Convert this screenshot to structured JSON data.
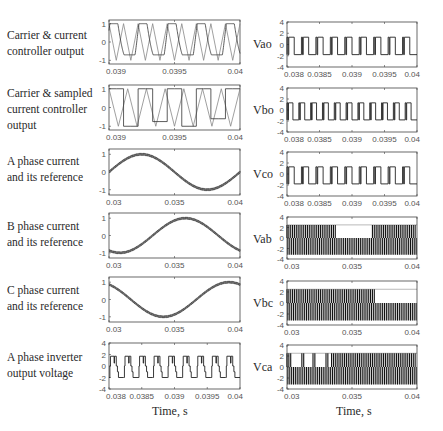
{
  "left_labels": [
    "Carrier & current\ncontroller output",
    "Carrier & sampled\ncurrent  controller\noutput",
    "A phase current\nand its reference",
    "B phase current\nand its reference",
    "C phase current\nand its reference",
    "A phase inverter\noutput voltage"
  ],
  "right_labels": [
    "Vao",
    "Vbo",
    "Vco",
    "Vab",
    "Vbc",
    "Vca"
  ],
  "xlabel_left": "Time, s",
  "xlabel_right": "Time, s",
  "chart_data": [
    {
      "type": "line",
      "title": "Carrier & current controller output",
      "xlim": [
        0.039,
        0.04
      ],
      "ylim": [
        -1.2,
        1.2
      ],
      "xticks": [
        "0.039",
        "0.0395",
        "0.04"
      ],
      "yticks": [
        "1",
        "0",
        "-1"
      ],
      "series": [
        {
          "name": "triangular carrier",
          "kind": "triangle",
          "periods": 9
        },
        {
          "name": "current controller output",
          "kind": "saturated-modulating"
        }
      ]
    },
    {
      "type": "line",
      "title": "Carrier & sampled current controller output",
      "xlim": [
        0.039,
        0.04
      ],
      "ylim": [
        -1.2,
        1.2
      ],
      "xticks": [
        "0.039",
        "0.0395",
        "0.04"
      ],
      "yticks": [
        "1",
        "0",
        "-1"
      ],
      "series": [
        {
          "name": "triangular carrier",
          "kind": "triangle",
          "periods": 7
        },
        {
          "name": "sampled controller output",
          "kind": "staircase",
          "levels": [
            1,
            1,
            -1,
            -1,
            1,
            1,
            -0.75,
            -0.75,
            1,
            1,
            -1,
            -1,
            1,
            1,
            -0.6,
            -0.6,
            1,
            1
          ]
        }
      ]
    },
    {
      "type": "line",
      "title": "A phase current and its reference",
      "xlim": [
        0.03,
        0.04
      ],
      "ylim": [
        -1.3,
        1.3
      ],
      "xticks": [
        "0.03",
        "0.035",
        "0.04"
      ],
      "yticks": [
        "1",
        "0",
        "-1"
      ],
      "series": [
        {
          "name": "current",
          "phase_deg": 0,
          "amplitude": 1,
          "cycles": 1,
          "ripple": 0.06
        },
        {
          "name": "reference",
          "phase_deg": 0,
          "amplitude": 1,
          "cycles": 1
        }
      ]
    },
    {
      "type": "line",
      "title": "B phase current and its reference",
      "xlim": [
        0.03,
        0.04
      ],
      "ylim": [
        -1.3,
        1.3
      ],
      "xticks": [
        "0.03",
        "0.035",
        "0.04"
      ],
      "yticks": [
        "1",
        "0",
        "-1"
      ],
      "series": [
        {
          "name": "current",
          "phase_deg": -120,
          "amplitude": 1,
          "cycles": 1,
          "ripple": 0.06
        },
        {
          "name": "reference",
          "phase_deg": -120,
          "amplitude": 1,
          "cycles": 1
        }
      ]
    },
    {
      "type": "line",
      "title": "C phase current and its reference",
      "xlim": [
        0.03,
        0.04
      ],
      "ylim": [
        -1.3,
        1.3
      ],
      "xticks": [
        "0.03",
        "0.035",
        "0.04"
      ],
      "yticks": [
        "1",
        "0",
        "-1"
      ],
      "series": [
        {
          "name": "current",
          "phase_deg": 120,
          "amplitude": 1,
          "cycles": 1,
          "ripple": 0.06
        },
        {
          "name": "reference",
          "phase_deg": 120,
          "amplitude": 1,
          "cycles": 1
        }
      ]
    },
    {
      "type": "line",
      "title": "A phase inverter output voltage",
      "xlim": [
        0.038,
        0.04
      ],
      "ylim": [
        -4,
        4
      ],
      "xticks": [
        "0.038",
        "0.0385",
        "0.039",
        "0.0395",
        "0.04"
      ],
      "yticks": [
        "4",
        "2",
        "0",
        "-2",
        "-4"
      ],
      "series": [
        {
          "name": "Van",
          "kind": "multilevel-pulses",
          "levels": [
            -2,
            -1,
            0,
            1,
            2
          ],
          "pulses": 9
        }
      ]
    },
    {
      "type": "line",
      "title": "Vao",
      "xlim": [
        0.038,
        0.04
      ],
      "ylim": [
        -4,
        4
      ],
      "xticks": [
        "0.038",
        "0.0385",
        "0.039",
        "0.0395",
        "0.04"
      ],
      "yticks": [
        "4",
        "2",
        "0",
        "-2",
        "-4"
      ],
      "series": [
        {
          "name": "Vao",
          "kind": "two-level-pulses",
          "high": 1.3,
          "low": -1.8,
          "pulses": 9
        }
      ]
    },
    {
      "type": "line",
      "title": "Vbo",
      "xlim": [
        0.038,
        0.04
      ],
      "ylim": [
        -4,
        4
      ],
      "xticks": [
        "0.038",
        "0.0385",
        "0.039",
        "0.0395",
        "0.04"
      ],
      "yticks": [
        "4",
        "2",
        "0",
        "-2",
        "-4"
      ],
      "series": [
        {
          "name": "Vbo",
          "kind": "two-level-pulses",
          "high": 1.3,
          "low": -1.8,
          "pulses": 11
        }
      ]
    },
    {
      "type": "line",
      "title": "Vco",
      "xlim": [
        0.038,
        0.04
      ],
      "ylim": [
        -4,
        4
      ],
      "xticks": [
        "0.038",
        "0.0385",
        "0.039",
        "0.0395",
        "0.04"
      ],
      "yticks": [
        "4",
        "2",
        "0",
        "-2",
        "-4"
      ],
      "series": [
        {
          "name": "Vco",
          "kind": "two-level-pulses",
          "high": 1.3,
          "low": -1.8,
          "pulses": 9
        }
      ]
    },
    {
      "type": "line",
      "title": "Vab",
      "xlim": [
        0.03,
        0.04
      ],
      "ylim": [
        -4,
        4
      ],
      "xticks": [
        "0.03",
        "0.035",
        "0.04"
      ],
      "yticks": [
        "4",
        "2",
        "0",
        "-2",
        "-4"
      ],
      "series": [
        {
          "name": "Vab",
          "kind": "line-voltage-pulses",
          "high": 2.5,
          "low": -3.2,
          "positive_until": 0.0338,
          "negative_from": 0.0338,
          "positive_from": 0.0365
        }
      ]
    },
    {
      "type": "line",
      "title": "Vbc",
      "xlim": [
        0.03,
        0.04
      ],
      "ylim": [
        -4,
        4
      ],
      "xticks": [
        "0.03",
        "0.035",
        "0.04"
      ],
      "yticks": [
        "4",
        "2",
        "0",
        "-2",
        "-4"
      ],
      "series": [
        {
          "name": "Vbc",
          "kind": "line-voltage-pulses",
          "high": 2.5,
          "low": -3.2,
          "positive_until": 0.0368,
          "negative_from": 0.0368
        }
      ]
    },
    {
      "type": "line",
      "title": "Vca",
      "xlim": [
        0.03,
        0.04
      ],
      "ylim": [
        -4,
        4
      ],
      "xticks": [
        "0.03",
        "0.035",
        "0.04"
      ],
      "yticks": [
        "4",
        "2",
        "0",
        "-2",
        "-4"
      ],
      "series": [
        {
          "name": "Vca",
          "kind": "line-voltage-pulses",
          "high": 2.5,
          "low": -3.2,
          "sparse_positive_until": 0.0333,
          "positive_from": 0.0333
        }
      ]
    }
  ]
}
